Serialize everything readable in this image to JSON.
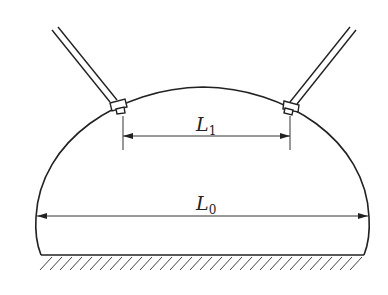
{
  "diagram": {
    "type": "engineering-schematic",
    "colors": {
      "stroke": "#222222",
      "background": "#ffffff",
      "hatch": "#444444"
    },
    "labels": {
      "l1": {
        "main": "L",
        "sub": "1"
      },
      "l0": {
        "main": "L",
        "sub": "0"
      }
    },
    "elements": {
      "dome": "dome-outline",
      "ground": "hatched-ground",
      "rods": [
        "left-inclined-rod",
        "right-inclined-rod"
      ],
      "dimensions": [
        "L1-dimension",
        "L0-dimension"
      ]
    }
  }
}
